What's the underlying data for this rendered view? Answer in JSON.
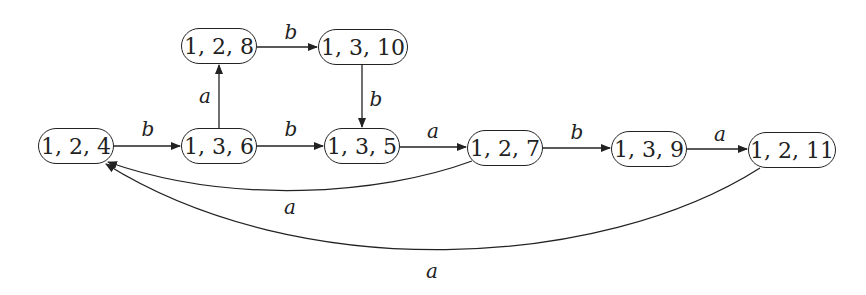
{
  "nodes": [
    {
      "id": "n124",
      "label": "1, 2, 4",
      "x": 38,
      "y": 128,
      "w": 76
    },
    {
      "id": "n136",
      "label": "1, 3, 6",
      "x": 181,
      "y": 128,
      "w": 76
    },
    {
      "id": "n128",
      "label": "1, 2, 8",
      "x": 181,
      "y": 28,
      "w": 76
    },
    {
      "id": "n1310",
      "label": "1, 3, 10",
      "x": 318,
      "y": 29,
      "w": 90
    },
    {
      "id": "n135",
      "label": "1, 3, 5",
      "x": 324,
      "y": 128,
      "w": 76
    },
    {
      "id": "n127",
      "label": "1, 2, 7",
      "x": 467,
      "y": 130,
      "w": 76
    },
    {
      "id": "n139",
      "label": "1, 3, 9",
      "x": 611,
      "y": 131,
      "w": 76
    },
    {
      "id": "n1211",
      "label": "1, 2, 11",
      "x": 748,
      "y": 132,
      "w": 88
    }
  ],
  "edges": [
    {
      "from": "1,2,4",
      "to": "1,3,6",
      "label": "b"
    },
    {
      "from": "1,3,6",
      "to": "1,2,8",
      "label": "a"
    },
    {
      "from": "1,2,8",
      "to": "1,3,10",
      "label": "b"
    },
    {
      "from": "1,3,10",
      "to": "1,3,5",
      "label": "b"
    },
    {
      "from": "1,3,6",
      "to": "1,3,5",
      "label": "b"
    },
    {
      "from": "1,3,5",
      "to": "1,2,7",
      "label": "a"
    },
    {
      "from": "1,2,7",
      "to": "1,3,9",
      "label": "b"
    },
    {
      "from": "1,3,9",
      "to": "1,2,11",
      "label": "a"
    },
    {
      "from": "1,2,7",
      "to": "1,2,4",
      "label": "a"
    },
    {
      "from": "1,2,11",
      "to": "1,2,4",
      "label": "a"
    }
  ],
  "labels": {
    "e1": "b",
    "e2": "a",
    "e3": "b",
    "e4": "b",
    "e5": "b",
    "e6": "a",
    "e7": "b",
    "e8": "a",
    "e9": "a",
    "e10": "a"
  }
}
